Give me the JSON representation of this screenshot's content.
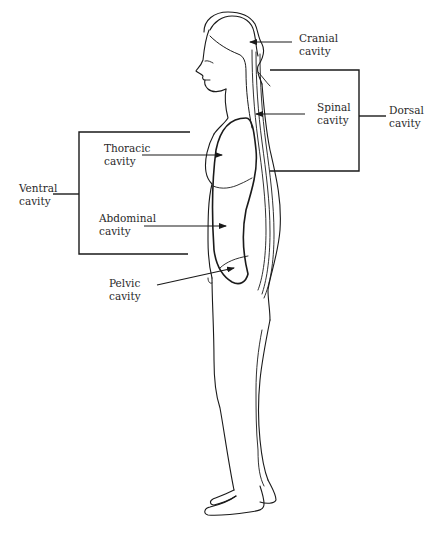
{
  "diagram": {
    "labels": {
      "cranial": {
        "line1": "Cranial",
        "line2": "cavity"
      },
      "spinal": {
        "line1": "Spinal",
        "line2": "cavity"
      },
      "dorsal": {
        "line1": "Dorsal",
        "line2": "cavity"
      },
      "thoracic": {
        "line1": "Thoracic",
        "line2": "cavity"
      },
      "ventral": {
        "line1": "Ventral",
        "line2": "cavity"
      },
      "abdominal": {
        "line1": "Abdominal",
        "line2": "cavity"
      },
      "pelvic": {
        "line1": "Pelvic",
        "line2": "cavity"
      }
    },
    "groups": [
      {
        "name": "Dorsal cavity",
        "members": [
          "Cranial cavity",
          "Spinal cavity"
        ]
      },
      {
        "name": "Ventral cavity",
        "members": [
          "Thoracic cavity",
          "Abdominal cavity",
          "Pelvic cavity"
        ]
      }
    ],
    "colors": {
      "line": "#1a1a1a",
      "text": "#2a2a2a",
      "background": "#ffffff"
    }
  }
}
